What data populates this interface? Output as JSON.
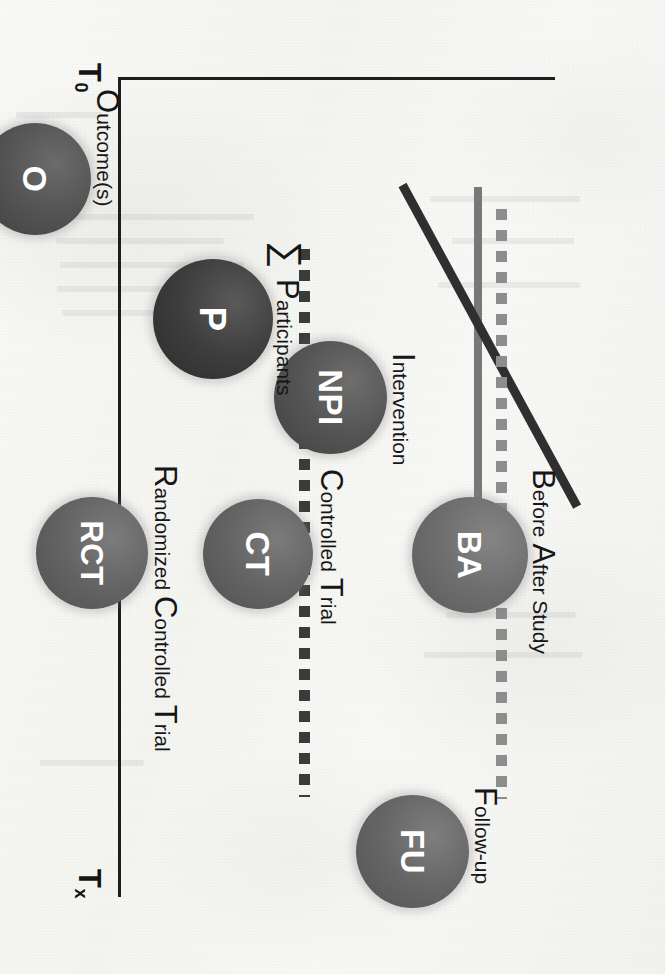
{
  "figure": {
    "kind": "study-design-timeline-diagram",
    "axes": {
      "x_ticks": [
        "T",
        "T",
        "T"
      ],
      "x_tick_subs": [
        "0",
        "1",
        "x"
      ],
      "t0": "T",
      "t0_sub": "0",
      "t1": "T",
      "t1_sub": "1",
      "tx": "T",
      "tx_sub": "x"
    },
    "sigma_symbol": "∑",
    "nodes": [
      {
        "id": "o",
        "label": "O",
        "annotation_cap": "O",
        "annotation_rest": "utcome(s)"
      },
      {
        "id": "p",
        "label": "P",
        "annotation_cap": "P",
        "annotation_rest": "articipants"
      },
      {
        "id": "npi",
        "label": "NPI",
        "annotation_cap": "I",
        "annotation_rest": "ntervention"
      },
      {
        "id": "ba",
        "label": "BA",
        "annotation_cap": "B",
        "annotation_rest": "efore ",
        "annotation_cap2": "A",
        "annotation_rest2": "fter Study"
      },
      {
        "id": "ct",
        "label": "CT",
        "annotation_cap": "C",
        "annotation_rest": "ontrolled ",
        "annotation_cap2": "T",
        "annotation_rest2": "rial"
      },
      {
        "id": "rct",
        "label": "RCT",
        "annotation_cap": "R",
        "annotation_rest": "andomized ",
        "annotation_cap2": "C",
        "annotation_rest2": "ontrolled ",
        "annotation_cap3": "T",
        "annotation_rest3": "rial"
      },
      {
        "id": "fu",
        "label": "FU",
        "annotation_cap": "F",
        "annotation_rest": "ollow-up"
      }
    ],
    "colors": {
      "paper": "#f6f6f4",
      "axis": "#1d1d1d",
      "dotted_dark": "#3b3b3b",
      "dotted_gray": "#8d8d8d",
      "bar_gray": "#787878",
      "diagonal_dark": "#2f2f2f",
      "node_fill_light": "#6e6e6e",
      "node_fill_dark": "#2b2b2b",
      "node_text": "#ffffff"
    }
  }
}
